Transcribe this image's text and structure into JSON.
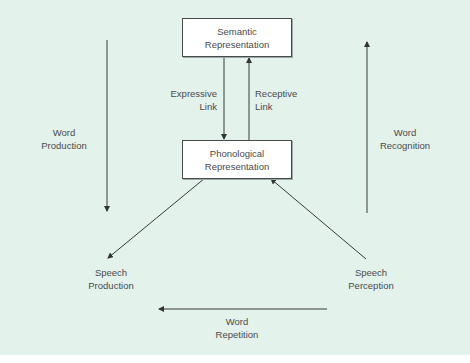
{
  "diagram": {
    "background": "#e3f2ea",
    "nodes": {
      "semantic": {
        "line1": "Semantic",
        "line2": "Representation"
      },
      "phonological": {
        "line1": "Phonological",
        "line2": "Representation"
      },
      "speech_production": {
        "line1": "Speech",
        "line2": "Production"
      },
      "speech_perception": {
        "line1": "Speech",
        "line2": "Perception"
      }
    },
    "edges": {
      "expressive_link": {
        "line1": "Expressive",
        "line2": "Link"
      },
      "receptive_link": {
        "line1": "Receptive",
        "line2": "Link"
      },
      "word_production": {
        "line1": "Word",
        "line2": "Production"
      },
      "word_recognition": {
        "line1": "Word",
        "line2": "Recognition"
      },
      "word_repetition": {
        "line1": "Word",
        "line2": "Repetition"
      }
    }
  }
}
